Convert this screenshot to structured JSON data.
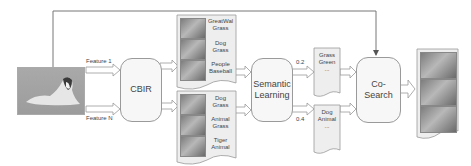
{
  "diagram": {
    "query_image": {
      "alt": "collie dog lying on grass"
    },
    "features": {
      "top": "Feature 1",
      "bottom": "Feature N"
    },
    "cbir": {
      "label": "CBIR"
    },
    "results_top": [
      {
        "line1": "GreatWal",
        "line2": "Grass"
      },
      {
        "line1": "Dog",
        "line2": "Grass"
      },
      {
        "line1": "People",
        "line2": "Baseball"
      }
    ],
    "results_bottom": [
      {
        "line1": "Dog",
        "line2": "Grass"
      },
      {
        "line1": "Animal",
        "line2": "Grass"
      },
      {
        "line1": "Tiger",
        "line2": "Animal"
      }
    ],
    "semantic": {
      "line1": "Semantic",
      "line2": "Learning"
    },
    "weights": {
      "top": "0.2",
      "bottom": "0.4"
    },
    "concepts_top": {
      "line1": "Grass",
      "line2": "Green",
      "line3": "..."
    },
    "concepts_bottom": {
      "line1": "Dog",
      "line2": "Animal",
      "line3": "..."
    },
    "cosearch": {
      "label": "Co-Search"
    },
    "final_results": {
      "count": 3,
      "alt": "retrieved dog images"
    }
  }
}
